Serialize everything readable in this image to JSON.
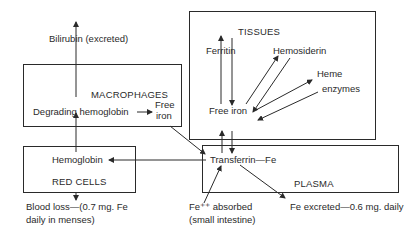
{
  "diagram": {
    "colors": {
      "stroke": "#2a2a2a",
      "background": "#ffffff",
      "text": "#2a2a2a"
    },
    "compartments": {
      "tissues": {
        "title": "TISSUES"
      },
      "macrophages": {
        "title": "MACROPHAGES"
      },
      "red_cells": {
        "title": "RED CELLS"
      },
      "plasma": {
        "title": "PLASMA"
      }
    },
    "nodes": {
      "bilirubin": "Bilirubin (excreted)",
      "degrading_hemoglobin": "Degrading hemoglobin",
      "macrophage_free_iron_line1": "Free",
      "macrophage_free_iron_line2": "iron",
      "hemoglobin": "Hemoglobin",
      "blood_loss_line1": "Blood loss—(0.7 mg. Fe",
      "blood_loss_line2": "daily in menses)",
      "ferritin": "Ferritin",
      "hemosiderin": "Hemosiderin",
      "heme": "Heme",
      "enzymes": "enzymes",
      "tissue_free_iron": "Free iron",
      "transferrin_fe": "Transferrin—Fe",
      "fe_absorbed_line1": "Fe⁺⁺ absorbed",
      "fe_absorbed_line2": "(small intestine)",
      "fe_excreted": "Fe excreted—0.6 mg. daily"
    }
  }
}
